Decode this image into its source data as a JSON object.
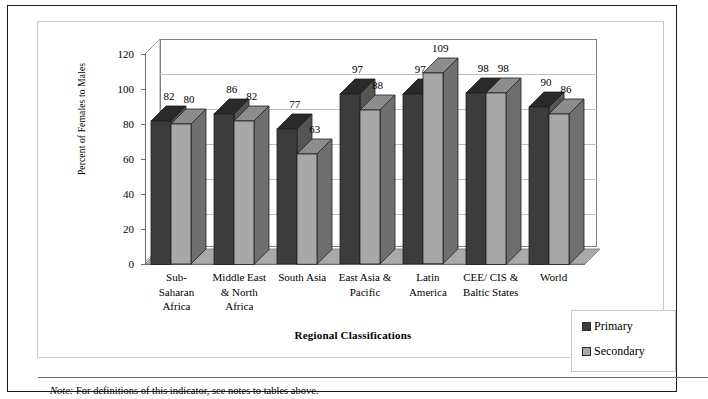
{
  "figure": {
    "footnote_label": "Note:",
    "footnote_text": "For definitions of this indicator, see notes to tables above."
  },
  "legend": {
    "items": [
      {
        "label": "Primary",
        "color": "#3c3c3c"
      },
      {
        "label": "Secondary",
        "color": "#a8a8a8"
      }
    ]
  },
  "colors": {
    "primary_face": "#3c3c3c",
    "primary_top": "#2a2a2a",
    "primary_side": "#555555",
    "secondary_face": "#a8a8a8",
    "secondary_top": "#8c8c8c",
    "secondary_side": "#6f6f6f",
    "floor": "#a9a9a9",
    "wall_line": "#808080",
    "grid": "#bfbfbf",
    "frame": "#1a1a1a"
  },
  "chart_data": {
    "type": "bar",
    "title": "",
    "xlabel": "Regional Classifications",
    "ylabel": "Percent of Females to Males",
    "ylim": [
      0,
      120
    ],
    "yticks": [
      0,
      20,
      40,
      60,
      80,
      100,
      120
    ],
    "grid": true,
    "legend_position": "bottom-right",
    "three_d": true,
    "categories": [
      "Sub-\nSaharan\nAfrica",
      "Middle East\n& North\nAfrica",
      "South Asia",
      "East Asia &\nPacific",
      "Latin\nAmerica",
      "CEE/ CIS &\nBaltic States",
      "World"
    ],
    "category_lines": [
      [
        "Sub-",
        "Saharan",
        "Africa"
      ],
      [
        "Middle East",
        "& North",
        "Africa"
      ],
      [
        "South Asia"
      ],
      [
        "East Asia &",
        "Pacific"
      ],
      [
        "Latin",
        "America"
      ],
      [
        "CEE/ CIS &",
        "Baltic States"
      ],
      [
        "World"
      ]
    ],
    "series": [
      {
        "name": "Primary",
        "values": [
          82,
          86,
          77,
          97,
          97,
          98,
          90
        ]
      },
      {
        "name": "Secondary",
        "values": [
          80,
          82,
          63,
          88,
          109,
          98,
          86
        ]
      }
    ]
  }
}
